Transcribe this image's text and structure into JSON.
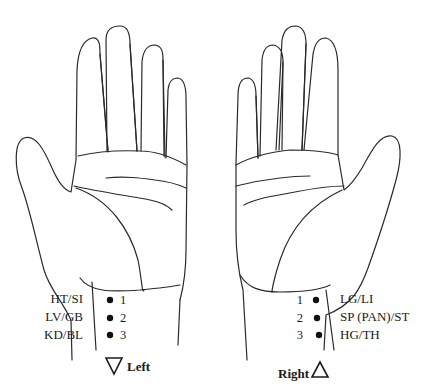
{
  "diagram": {
    "type": "anatomical-line-drawing",
    "colors": {
      "line": "#2a2a2a",
      "text": "#1a1a1a",
      "background": "#ffffff"
    },
    "left_hand": {
      "side_label": "Left",
      "side_marker": "down-triangle",
      "positions": [
        {
          "number": "1",
          "label": "HT/SI"
        },
        {
          "number": "2",
          "label": "LV/GB"
        },
        {
          "number": "3",
          "label": "KD/BL"
        }
      ]
    },
    "right_hand": {
      "side_label": "Right",
      "side_marker": "up-triangle",
      "positions": [
        {
          "number": "1",
          "label": "LG/LI"
        },
        {
          "number": "2",
          "label": "SP (PAN)/ST"
        },
        {
          "number": "3",
          "label": "HG/TH"
        }
      ]
    }
  }
}
